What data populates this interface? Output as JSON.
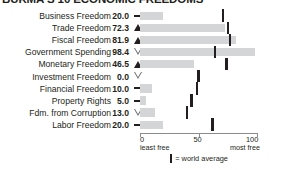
{
  "title": "BURMA'S 10 ECONOMIC FREEDOMS",
  "legend": {
    "marker_icon": "vertical-tick-icon",
    "text": "= world average"
  },
  "axis": {
    "ticks": [
      {
        "value": 0,
        "label": "0",
        "sub": "least free"
      },
      {
        "value": 50,
        "label": "50",
        "sub": ""
      },
      {
        "value": 100,
        "label": "100",
        "sub": "most free"
      }
    ],
    "min": 0,
    "max": 100
  },
  "chart_data": {
    "type": "bar",
    "title": "BURMA'S 10 ECONOMIC FREEDOMS",
    "xlabel": "",
    "ylabel": "",
    "xlim": [
      0,
      100
    ],
    "grid": false,
    "orientation": "horizontal",
    "legend_position": "bottom",
    "categories": [
      "Business Freedom",
      "Trade Freedom",
      "Fiscal Freedom",
      "Government Spending",
      "Monetary Freedom",
      "Investment Freedom",
      "Financial Freedom",
      "Property Rights",
      "Fdm. from Corruption",
      "Labor Freedom"
    ],
    "values": [
      20.0,
      72.3,
      81.9,
      98.4,
      46.5,
      0.0,
      10.0,
      5.0,
      13.0,
      20.0
    ],
    "value_labels": [
      "20.0",
      "72.3",
      "81.9",
      "98.4",
      "46.5",
      "0.0",
      "10.0",
      "5.0",
      "13.0",
      "20.0"
    ],
    "trends": [
      "flat",
      "up",
      "up",
      "down",
      "up",
      "down",
      "flat",
      "flat",
      "down",
      "flat"
    ],
    "world_average": [
      71,
      75,
      77,
      64,
      74,
      50,
      49,
      44,
      40,
      62
    ],
    "series": [
      {
        "name": "Burma score",
        "values": [
          20.0,
          72.3,
          81.9,
          98.4,
          46.5,
          0.0,
          10.0,
          5.0,
          13.0,
          20.0
        ]
      },
      {
        "name": "world average",
        "values": [
          71,
          75,
          77,
          64,
          74,
          50,
          49,
          44,
          40,
          62
        ]
      }
    ]
  },
  "colors": {
    "bar": "#d4d5d7",
    "tick": "#231f20",
    "axis": "#8a8b8d",
    "text": "#231f20"
  }
}
